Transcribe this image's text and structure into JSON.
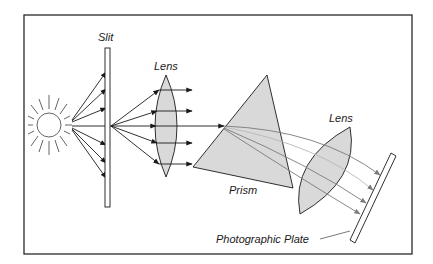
{
  "diagram": {
    "type": "optical-spectrograph-schematic",
    "labels": {
      "slit": "Slit",
      "lens1": "Lens",
      "prism": "Prism",
      "lens2": "Lens",
      "plate": "Photographic Plate"
    },
    "components": [
      {
        "id": "light-source",
        "kind": "sun",
        "description": "Light source emitting rays"
      },
      {
        "id": "slit",
        "kind": "slit",
        "label_key": "slit"
      },
      {
        "id": "collimating-lens",
        "kind": "biconvex-lens",
        "label_key": "lens1"
      },
      {
        "id": "prism",
        "kind": "triangular-prism",
        "label_key": "prism"
      },
      {
        "id": "focusing-lens",
        "kind": "biconvex-lens",
        "label_key": "lens2"
      },
      {
        "id": "photographic-plate",
        "kind": "plate",
        "label_key": "plate"
      }
    ],
    "flow": [
      "light-source",
      "slit",
      "collimating-lens",
      "prism",
      "focusing-lens",
      "photographic-plate"
    ],
    "colors": {
      "frame": "#2a2a2a",
      "line": "#1a1a1a",
      "fill_gray": "#d9d9d9",
      "dispersed_rays": "#7a7a7a",
      "sun": "#555555"
    }
  }
}
